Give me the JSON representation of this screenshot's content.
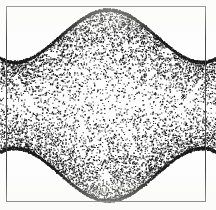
{
  "figure": {
    "medium": "dithered halftone scan",
    "frame": {
      "visible": true,
      "stroke_color": "#4a4a4a",
      "stroke_width": 1,
      "inset_px": 6,
      "width_px": 200,
      "height_px": 196
    },
    "canvas": {
      "width_px": 216,
      "height_px": 210,
      "background_color": "#ffffff"
    },
    "texture": {
      "kind": "random-stipple",
      "ink_color": "#1a1a1a",
      "paper_color": "#ffffff",
      "max_density": 0.62,
      "min_density": 0.1,
      "edge_darkening": true
    },
    "shape": {
      "name": "four-cusp-hourglass",
      "symmetry": "horizontal and vertical mirror",
      "top_peak_x": 108,
      "top_peak_y": 8,
      "bottom_peak_x": 108,
      "bottom_peak_y": 202,
      "left_cusp_y": 105,
      "right_cusp_y": 105,
      "top_trough_left_x": 40,
      "top_trough_right_x": 176,
      "top_trough_y": 46,
      "bottom_trough_y": 164
    },
    "highlights": [
      {
        "name": "left-streak",
        "x": 26,
        "y": 95,
        "angle_deg": 55
      },
      {
        "name": "right-streak",
        "x": 190,
        "y": 95,
        "angle_deg": -55
      },
      {
        "name": "upper-left-mark",
        "x": 52,
        "y": 52
      },
      {
        "name": "upper-right-mark",
        "x": 166,
        "y": 52
      },
      {
        "name": "lower-center-mark",
        "x": 104,
        "y": 176
      }
    ]
  }
}
